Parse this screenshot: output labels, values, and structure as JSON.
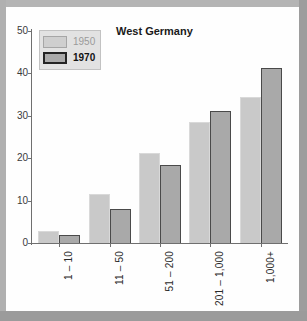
{
  "chart_data": {
    "type": "bar",
    "title": "West Germany",
    "xlabel": "",
    "ylabel": "",
    "categories": [
      "1 – 10",
      "11 – 50",
      "51 – 200",
      "201 – 1,000",
      "1,000+"
    ],
    "series": [
      {
        "name": "1950",
        "values": [
          2.8,
          11.6,
          21.2,
          28.5,
          34.4
        ],
        "color": "#c9c9c9"
      },
      {
        "name": "1970",
        "values": [
          1.9,
          8.0,
          18.4,
          31.1,
          41.3
        ],
        "color": "#a9a9a9"
      }
    ],
    "ylim": [
      0,
      50
    ],
    "yticks": [
      0,
      10,
      20,
      30,
      40,
      50
    ],
    "ytick_labels": [
      "0",
      "10",
      "20",
      "30",
      "40",
      "50"
    ],
    "grid": false,
    "legend_position": "top-left",
    "xtick_rotation": -90
  },
  "legend": {
    "entries": [
      {
        "label": "1950"
      },
      {
        "label": "1970"
      }
    ]
  },
  "colors": {
    "series_1950_fill": "#c9c9c9",
    "series_1970_fill": "#a9a9a9",
    "series_1970_edge": "#4a4a4a",
    "axis": "#6f6f6f",
    "frame": "#a9a9a9",
    "panel": "#fefefe"
  }
}
